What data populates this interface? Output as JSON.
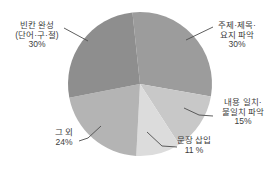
{
  "chart_data": {
    "type": "pie",
    "title": "",
    "legend": "none",
    "background_color": "#ffffff",
    "text_color": "#3d3d3d",
    "pointer_line_color": "#4d4d4d",
    "layout": {
      "cx": 140,
      "cy": 84,
      "r": 72,
      "start_angle_deg": -6
    },
    "categories": [
      "주제·제목·요지 파악",
      "내용 일치·불일치 파악",
      "문장 삽입",
      "그 외",
      "빈칸 완성 (단어·구·절)"
    ],
    "values": [
      30,
      15,
      11,
      24,
      30
    ],
    "slices": [
      {
        "name": "주제·제목·요지 파악",
        "label_lines": [
          "주제·제목·",
          "요지 파악"
        ],
        "value": 30,
        "value_label": "30%",
        "color": "#9c9c9c",
        "draw_start": -6,
        "draw_sweep": 106
      },
      {
        "name": "내용 일치·불일치 파악",
        "label_lines": [
          "내용 일치·",
          "불일치 파악"
        ],
        "value": 15,
        "value_label": "15%",
        "color": "#c8c8c8",
        "draw_start": 100,
        "draw_sweep": 47
      },
      {
        "name": "문장 삽입",
        "label_lines": [
          "문장 삽입"
        ],
        "value": 11,
        "value_label": "11 %",
        "color": "#dcdcdc",
        "draw_start": 147,
        "draw_sweep": 36
      },
      {
        "name": "그 외",
        "label_lines": [
          "그 외"
        ],
        "value": 24,
        "value_label": "24%",
        "color": "#b4b4b4",
        "draw_start": 183,
        "draw_sweep": 76
      },
      {
        "name": "빈칸 완성 (단어·구·절)",
        "label_lines": [
          "빈칸 완성",
          "(단어·구·절)"
        ],
        "value": 30,
        "value_label": "30%",
        "color": "#8e8e8e",
        "draw_start": 259,
        "draw_sweep": 95
      }
    ]
  }
}
